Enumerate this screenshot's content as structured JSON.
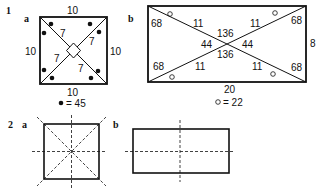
{
  "problem1": {
    "number": "1",
    "a": {
      "label": "a",
      "top": "10",
      "left": "10",
      "right": "10",
      "bottom": "10",
      "diag_top_left": "7",
      "diag_top_right": "7",
      "diag_bottom_left": "7",
      "diag_bottom_right": "7",
      "legend": "= 45",
      "legend_symbol": "filled-dot"
    },
    "b": {
      "label": "b",
      "corner_tl": "68",
      "corner_tr": "68",
      "corner_bl": "68",
      "corner_br": "68",
      "inner_tl": "11",
      "inner_tr": "11",
      "inner_bl": "11",
      "inner_br": "11",
      "center_top": "136",
      "center_bottom": "136",
      "center_left": "44",
      "center_right": "44",
      "right_side": "8",
      "bottom_side": "20",
      "legend": "= 22",
      "legend_symbol": "open-circle"
    }
  },
  "problem2": {
    "number": "2",
    "a": {
      "label": "a",
      "shape": "square with 4 dashed lines of symmetry"
    },
    "b": {
      "label": "b",
      "shape": "rectangle with 2 dashed lines of symmetry"
    }
  },
  "colors": {
    "ink": "#111111",
    "background": "#ffffff"
  }
}
